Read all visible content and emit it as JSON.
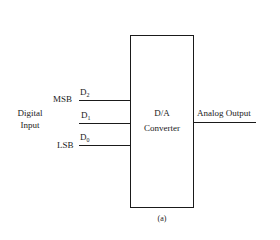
{
  "diagram": {
    "block": {
      "label_line1": "D/A",
      "label_line2": "Converter"
    },
    "input_group_label_line1": "Digital",
    "input_group_label_line2": "Input",
    "inputs": [
      {
        "name": "D",
        "sub": "2",
        "side_label": "MSB"
      },
      {
        "name": "D",
        "sub": "1",
        "side_label": ""
      },
      {
        "name": "D",
        "sub": "0",
        "side_label": "LSB"
      }
    ],
    "output_label": "Analog Output",
    "caption": "(a)"
  }
}
